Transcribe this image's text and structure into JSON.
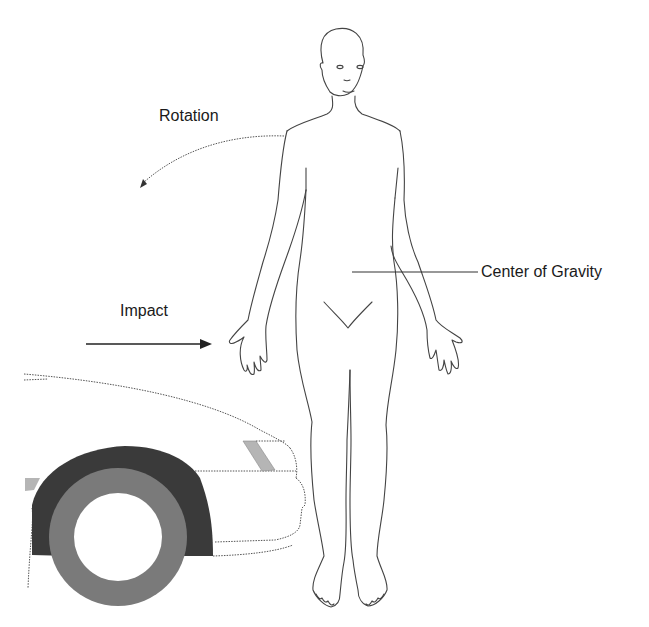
{
  "figure": {
    "type": "diagram",
    "labels": {
      "rotation": "Rotation",
      "impact": "Impact",
      "center_of_gravity": "Center of Gravity"
    },
    "colors": {
      "line": "#444444",
      "wheel_arch": "#3a3a3a",
      "tire": "#7a7a7a",
      "light_lens": "#b5b5b5",
      "background": "#ffffff"
    }
  }
}
